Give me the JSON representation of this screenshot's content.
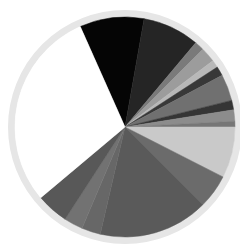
{
  "chart_data": {
    "type": "pie",
    "title": "",
    "legend": [],
    "start_angle_deg": -24,
    "direction": "clockwise",
    "center": [
      125,
      127
    ],
    "radius": 110,
    "ring": {
      "radius": 117,
      "width": 7,
      "color": "#e6e6e6"
    },
    "slices": [
      {
        "label": "",
        "value": 34,
        "color": "#050505"
      },
      {
        "label": "",
        "value": 30,
        "color": "#252525"
      },
      {
        "label": "",
        "value": 5,
        "color": "#7a7a7a"
      },
      {
        "label": "",
        "value": 8,
        "color": "#9c9c9c"
      },
      {
        "label": "",
        "value": 4,
        "color": "#b8b8b8"
      },
      {
        "label": "",
        "value": 5,
        "color": "#383838"
      },
      {
        "label": "",
        "value": 14,
        "color": "#707070"
      },
      {
        "label": "",
        "value": 5,
        "color": "#353535"
      },
      {
        "label": "",
        "value": 6,
        "color": "#8c8c8c"
      },
      {
        "label": "",
        "value": 3,
        "color": "#767676"
      },
      {
        "label": "",
        "value": 27,
        "color": "#c9c9c9"
      },
      {
        "label": "",
        "value": 18,
        "color": "#6b6b6b"
      },
      {
        "label": "",
        "value": 58,
        "color": "#5a5a5a"
      },
      {
        "label": "",
        "value": 10,
        "color": "#676767"
      },
      {
        "label": "",
        "value": 10,
        "color": "#727272"
      },
      {
        "label": "",
        "value": 17,
        "color": "#585858"
      },
      {
        "label": "",
        "value": 106,
        "color": "#ffffff"
      }
    ],
    "units": "degrees-equivalent (estimated from slice angles)"
  }
}
